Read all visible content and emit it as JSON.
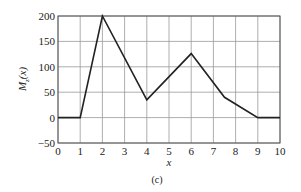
{
  "chart_data": {
    "type": "line",
    "title": "",
    "caption": "(c)",
    "xlabel": "x",
    "ylabel": "M_z(x)",
    "ylabel_main": "M",
    "ylabel_sub": "z",
    "ylabel_arg": "(x)",
    "xlim": [
      0,
      10
    ],
    "ylim": [
      -50,
      200
    ],
    "grid": true,
    "xticks": [
      0,
      1,
      2,
      3,
      4,
      5,
      6,
      7,
      8,
      9,
      10
    ],
    "yticks": [
      -50,
      0,
      50,
      100,
      150,
      200
    ],
    "ytick_labels": [
      "−50",
      "0",
      "50",
      "100",
      "150",
      "200"
    ],
    "series": [
      {
        "name": "M_z(x)",
        "color": "#222222",
        "x": [
          0,
          1,
          2,
          4,
          6,
          7.5,
          9,
          10
        ],
        "y": [
          0,
          0,
          200,
          35,
          126,
          40,
          0,
          0
        ]
      }
    ]
  }
}
